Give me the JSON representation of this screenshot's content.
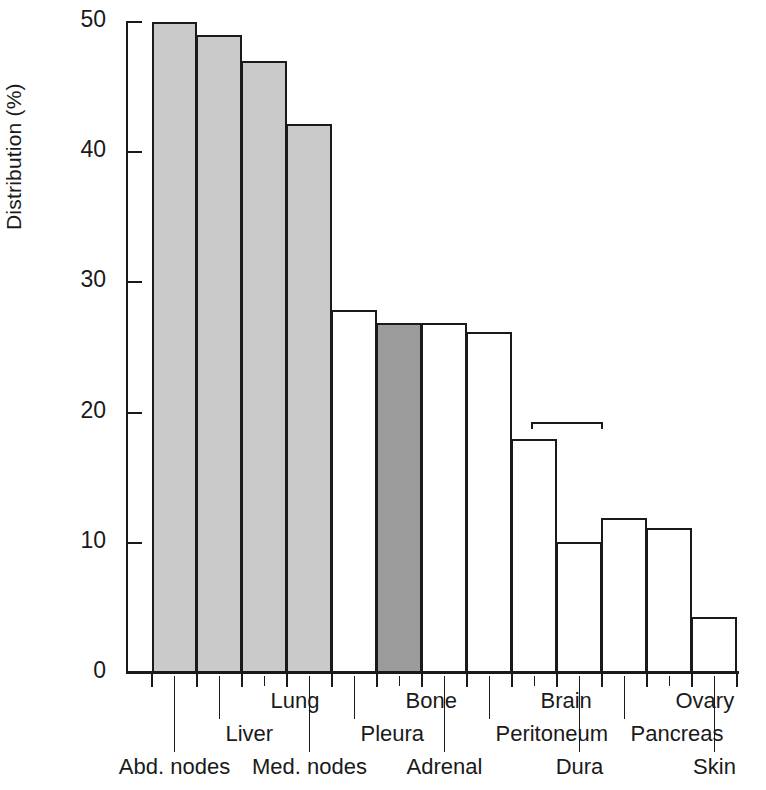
{
  "chart_data": {
    "type": "bar",
    "title": "",
    "xlabel": "",
    "ylabel": "Distribution (%)",
    "ylim": [
      0,
      50
    ],
    "yticks": [
      0,
      10,
      20,
      30,
      40,
      50
    ],
    "grid": false,
    "legend": "none",
    "categories": [
      "Abd. nodes",
      "Liver",
      "Lung",
      "Med. nodes",
      "Pleura",
      "Bone",
      "Adrenal",
      "Peritoneum",
      "Brain",
      "Dura",
      "Pancreas",
      "Ovary",
      "Skin"
    ],
    "values": [
      50,
      49,
      47,
      42.2,
      27.9,
      26.9,
      26.9,
      26.2,
      18,
      10.1,
      11.9,
      11.1,
      4.3
    ],
    "bar_shading": [
      "light",
      "light",
      "light",
      "light",
      "none",
      "dark",
      "none",
      "none",
      "none",
      "none",
      "none",
      "none",
      "none"
    ],
    "annotations": [
      {
        "type": "bracket",
        "spans": [
          "Brain",
          "Dura"
        ],
        "y_value": 19.3,
        "text": ""
      }
    ]
  },
  "colors": {
    "shade_light": "#cacaca",
    "shade_dark": "#9b9b9b",
    "shade_none": "#ffffff",
    "outline": "#1a1a1a",
    "background": "#ffffff"
  },
  "axis": {
    "y_tick_labels": [
      "50",
      "40",
      "30",
      "20",
      "10",
      "0"
    ],
    "y_axis_title": "Distribution (%)"
  },
  "labels": {
    "row_top": [
      "Lung",
      "Bone",
      "Brain",
      "Ovary"
    ],
    "row_mid": [
      "Liver",
      "Pleura",
      "Peritoneum",
      "Pancreas"
    ],
    "row_bottom": [
      "Abd. nodes",
      "Med. nodes",
      "Adrenal",
      "Dura",
      "Skin"
    ]
  }
}
